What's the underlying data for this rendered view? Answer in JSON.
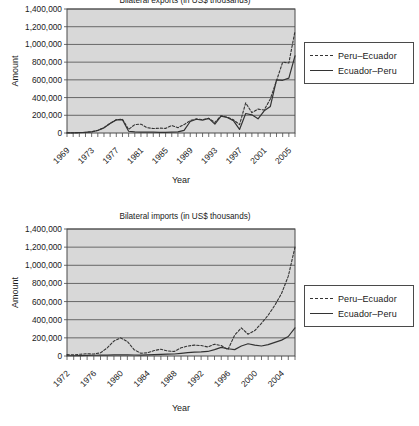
{
  "page": {
    "background": "#ffffff",
    "plot_fill": "#d8d8d8",
    "line_color": "#333333"
  },
  "figures": [
    {
      "id": "exports",
      "title": "Bilateral exports (in US$ thousands)",
      "title_clipped": true
    },
    {
      "id": "imports",
      "title": "Bilateral imports (in US$ thousands)",
      "title_clipped": false
    }
  ],
  "legend": {
    "dashed_label": "Peru–Ecuador",
    "solid_label": "Ecuador–Peru"
  },
  "chart_data": [
    {
      "type": "line",
      "id": "exports",
      "title": "Bilateral exports (in US$ thousands)",
      "xlabel": "Year",
      "ylabel": "Amount",
      "ylim": [
        0,
        1400000
      ],
      "ytick_labels": [
        "0",
        "200,000",
        "400,000",
        "600,000",
        "800,000",
        "1,000,000",
        "1,200,000",
        "1,400,000"
      ],
      "yticks": [
        0,
        200000,
        400000,
        600000,
        800000,
        1000000,
        1200000,
        1400000
      ],
      "xlim": [
        1969,
        2006
      ],
      "xtick_labels": [
        "1969",
        "1973",
        "1977",
        "1981",
        "1985",
        "1989",
        "1993",
        "1997",
        "2001",
        "2005"
      ],
      "xticks": [
        1969,
        1973,
        1977,
        1981,
        1985,
        1989,
        1993,
        1997,
        2001,
        2005
      ],
      "grid": true,
      "legend_position": "right",
      "x": [
        1969,
        1970,
        1971,
        1972,
        1973,
        1974,
        1975,
        1976,
        1977,
        1978,
        1979,
        1980,
        1981,
        1982,
        1983,
        1984,
        1985,
        1986,
        1987,
        1988,
        1989,
        1990,
        1991,
        1992,
        1993,
        1994,
        1995,
        1996,
        1997,
        1998,
        1999,
        2000,
        2001,
        2002,
        2003,
        2004,
        2005,
        2006
      ],
      "series": [
        {
          "name": "Peru–Ecuador",
          "style": "dashed",
          "values": [
            2000,
            3000,
            5000,
            8000,
            14000,
            30000,
            60000,
            110000,
            150000,
            155000,
            40000,
            95000,
            100000,
            60000,
            50000,
            55000,
            52000,
            85000,
            60000,
            95000,
            140000,
            160000,
            150000,
            165000,
            120000,
            195000,
            180000,
            150000,
            95000,
            340000,
            230000,
            270000,
            260000,
            385000,
            590000,
            800000,
            790000,
            1150000
          ]
        },
        {
          "name": "Ecuador–Peru",
          "style": "solid",
          "values": [
            1000,
            2000,
            4000,
            7000,
            12000,
            28000,
            58000,
            108000,
            148000,
            150000,
            20000,
            12000,
            10000,
            10000,
            9000,
            8000,
            8000,
            10000,
            12000,
            30000,
            130000,
            155000,
            145000,
            165000,
            100000,
            190000,
            175000,
            140000,
            40000,
            220000,
            205000,
            160000,
            250000,
            300000,
            600000,
            595000,
            620000,
            870000
          ]
        }
      ]
    },
    {
      "type": "line",
      "id": "imports",
      "title": "Bilateral imports (in US$ thousands)",
      "xlabel": "Year",
      "ylabel": "Amount",
      "ylim": [
        0,
        1400000
      ],
      "ytick_labels": [
        "0",
        "200,000",
        "400,000",
        "600,000",
        "800,000",
        "1,000,000",
        "1,200,000",
        "1,400,000"
      ],
      "yticks": [
        0,
        200000,
        400000,
        600000,
        800000,
        1000000,
        1200000,
        1400000
      ],
      "xlim": [
        1972,
        2006
      ],
      "xtick_labels": [
        "1972",
        "1976",
        "1980",
        "1984",
        "1988",
        "1992",
        "1996",
        "2000",
        "2004"
      ],
      "xticks": [
        1972,
        1976,
        1980,
        1984,
        1988,
        1992,
        1996,
        2000,
        2004
      ],
      "grid": true,
      "legend_position": "right",
      "x": [
        1972,
        1973,
        1974,
        1975,
        1976,
        1977,
        1978,
        1979,
        1980,
        1981,
        1982,
        1983,
        1984,
        1985,
        1986,
        1987,
        1988,
        1989,
        1990,
        1991,
        1992,
        1993,
        1994,
        1995,
        1996,
        1997,
        1998,
        1999,
        2000,
        2001,
        2002,
        2003,
        2004,
        2005,
        2006
      ],
      "series": [
        {
          "name": "Peru–Ecuador",
          "style": "dashed",
          "values": [
            15000,
            12000,
            20000,
            25000,
            22000,
            35000,
            90000,
            165000,
            200000,
            160000,
            70000,
            30000,
            35000,
            60000,
            75000,
            55000,
            50000,
            90000,
            110000,
            120000,
            115000,
            100000,
            130000,
            115000,
            70000,
            230000,
            310000,
            240000,
            280000,
            360000,
            450000,
            560000,
            690000,
            880000,
            1200000
          ]
        },
        {
          "name": "Ecuador–Peru",
          "style": "solid",
          "values": [
            3000,
            3000,
            5000,
            7000,
            8000,
            9000,
            10000,
            12000,
            14000,
            13000,
            11000,
            10000,
            12000,
            15000,
            18000,
            20000,
            22000,
            30000,
            38000,
            42000,
            45000,
            50000,
            70000,
            95000,
            80000,
            70000,
            110000,
            135000,
            120000,
            110000,
            125000,
            150000,
            175000,
            215000,
            310000
          ]
        }
      ]
    }
  ]
}
